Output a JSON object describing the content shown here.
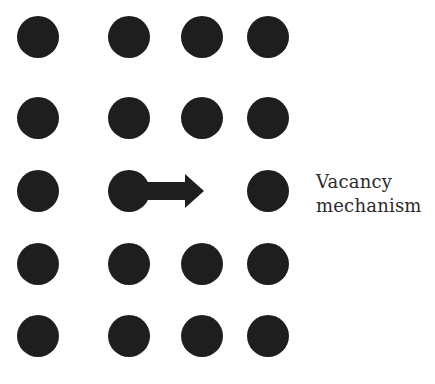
{
  "diagram": {
    "atom_color": "#1e1e1e",
    "atom_radius": 21,
    "columns_x": [
      38,
      129,
      202,
      268
    ],
    "rows_y": [
      37,
      118,
      191,
      264,
      336
    ],
    "atoms": [
      {
        "row": 0,
        "col": 0
      },
      {
        "row": 0,
        "col": 1
      },
      {
        "row": 0,
        "col": 2
      },
      {
        "row": 0,
        "col": 3
      },
      {
        "row": 1,
        "col": 0
      },
      {
        "row": 1,
        "col": 1
      },
      {
        "row": 1,
        "col": 2
      },
      {
        "row": 1,
        "col": 3
      },
      {
        "row": 2,
        "col": 0
      },
      {
        "row": 2,
        "col": 1
      },
      {
        "row": 2,
        "col": 3
      },
      {
        "row": 3,
        "col": 0
      },
      {
        "row": 3,
        "col": 1
      },
      {
        "row": 3,
        "col": 2
      },
      {
        "row": 3,
        "col": 3
      },
      {
        "row": 4,
        "col": 0
      },
      {
        "row": 4,
        "col": 1
      },
      {
        "row": 4,
        "col": 2
      },
      {
        "row": 4,
        "col": 3
      }
    ],
    "vacancy": {
      "row": 2,
      "col": 2
    },
    "arrow": {
      "from_col": 1,
      "to_col": 2,
      "row": 2,
      "shaft_end_x": 185,
      "tip_x": 204,
      "shaft_half_height": 9,
      "head_half_height": 17,
      "color": "#1e1e1e"
    },
    "label": {
      "line1": "Vacancy",
      "line2": "mechanism"
    }
  }
}
